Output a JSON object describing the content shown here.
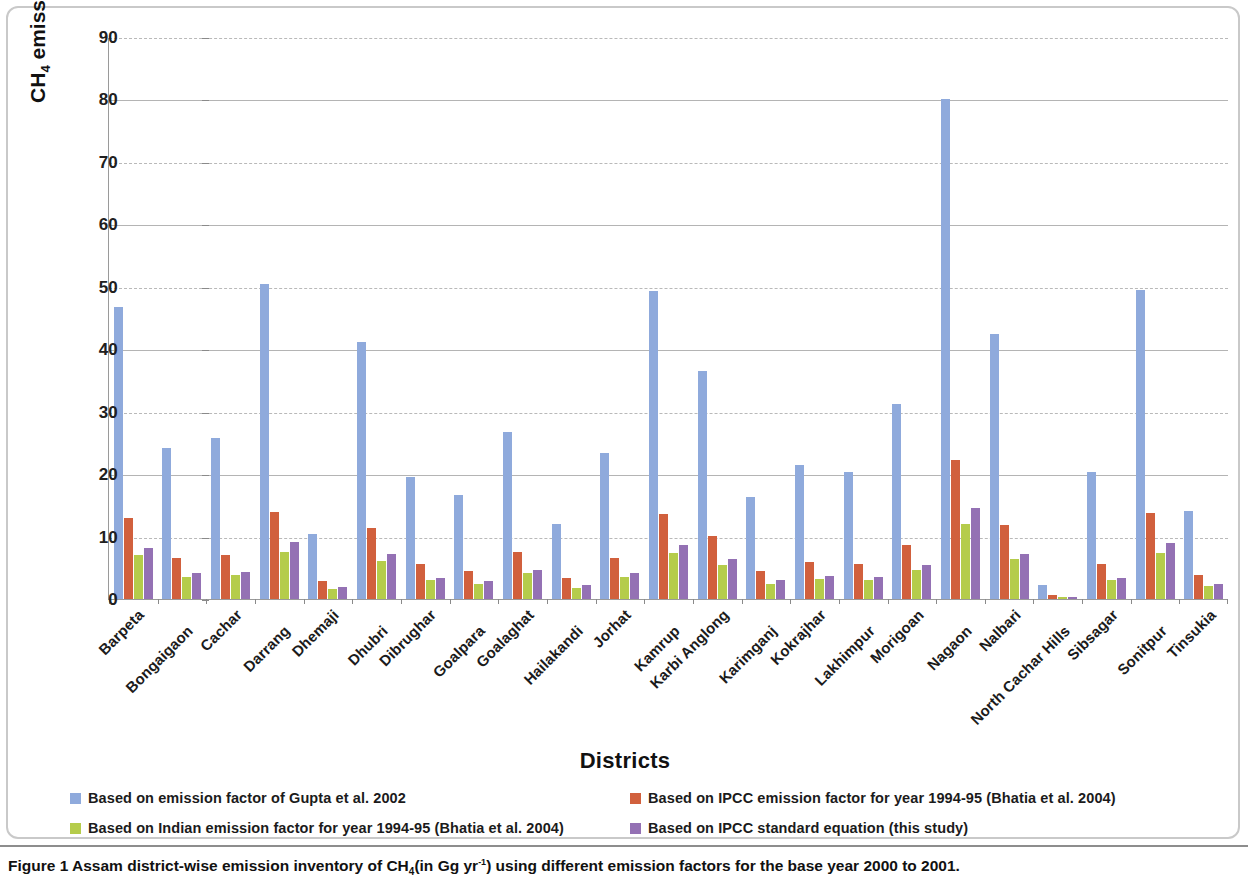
{
  "figure": {
    "caption_prefix": "Figure 1",
    "caption_text": "Assam district-wise emission inventory of CH",
    "caption_sub": "4",
    "caption_mid": "(in Gg yr",
    "caption_sup": "-1",
    "caption_tail": ") using different emission factors for the base year 2000 to 2001."
  },
  "axis": {
    "ylabel_main": "CH",
    "ylabel_sub": "4",
    "ylabel_rest": " emission (Gg yr",
    "ylabel_sup": "-1",
    "ylabel_close": ")",
    "xlabel": "Districts"
  },
  "colors": {
    "series1": "#8FAADC",
    "series2": "#D1603D",
    "series3": "#B5CC4B",
    "series4": "#9471B4",
    "gridline": "#b9b9b9",
    "axis": "#8a8a8a"
  },
  "legend": [
    {
      "label": "Based on emission factor of Gupta et al. 2002",
      "color": "#8FAADC"
    },
    {
      "label": "Based on IPCC emission factor for year 1994-95 (Bhatia et al. 2004)",
      "color": "#D1603D"
    },
    {
      "label": "Based on Indian  emission factor for year 1994-95 (Bhatia et al. 2004)",
      "color": "#B5CC4B"
    },
    {
      "label": "Based on IPCC standard equation (this study)",
      "color": "#9471B4"
    }
  ],
  "chart_data": {
    "type": "bar",
    "xlabel": "Districts",
    "ylabel": "CH4 emission (Gg yr-1)",
    "ylim": [
      0,
      90
    ],
    "ytick_values": [
      0,
      10,
      20,
      30,
      40,
      50,
      60,
      70,
      80,
      90
    ],
    "ytick_labels": [
      "0",
      "10",
      "20",
      "30",
      "40",
      "50",
      "60",
      "70",
      "80",
      "90"
    ],
    "grid": true,
    "legend_position": "bottom",
    "categories": [
      "Barpeta",
      "Bongaigaon",
      "Cachar",
      "Darrang",
      "Dhemaji",
      "Dhubri",
      "Dibrughar",
      "Goalpara",
      "Goalaghat",
      "Hailakandi",
      "Jorhat",
      "Kamrup",
      "Karbi Anglong",
      "Karimganj",
      "Kokrajhar",
      "Lakhimpur",
      "Morigoan",
      "Nagaon",
      "Nalbari",
      "North Cachar Hills",
      "Sibsagar",
      "Sonitpur",
      "Tinsukia"
    ],
    "series": [
      {
        "name": "Based on emission factor of Gupta et al. 2002",
        "color": "#8FAADC",
        "values": [
          46.8,
          24.2,
          25.8,
          50.5,
          10.4,
          41.2,
          19.5,
          16.7,
          26.8,
          12.0,
          23.4,
          49.4,
          36.5,
          16.3,
          21.4,
          20.3,
          31.2,
          80.0,
          42.4,
          2.2,
          20.3,
          49.5,
          14.1
        ]
      },
      {
        "name": "Based on IPCC emission factor for year 1994-95 (Bhatia et al. 2004)",
        "color": "#D1603D",
        "values": [
          12.9,
          6.5,
          7.1,
          13.9,
          2.9,
          11.3,
          5.6,
          4.5,
          7.6,
          3.3,
          6.5,
          13.6,
          10.1,
          4.5,
          5.9,
          5.6,
          8.7,
          22.2,
          11.8,
          0.6,
          5.6,
          13.7,
          3.9
        ]
      },
      {
        "name": "Based on Indian  emission factor for year 1994-95 (Bhatia et al. 2004)",
        "color": "#B5CC4B",
        "values": [
          7.0,
          3.5,
          3.8,
          7.5,
          1.6,
          6.1,
          3.0,
          2.4,
          4.1,
          1.8,
          3.5,
          7.4,
          5.5,
          2.4,
          3.2,
          3.0,
          4.7,
          12.0,
          6.4,
          0.3,
          3.0,
          7.4,
          2.1
        ]
      },
      {
        "name": "Based on IPCC standard equation (this study)",
        "color": "#9471B4",
        "values": [
          8.2,
          4.2,
          4.4,
          9.1,
          1.9,
          7.2,
          3.3,
          2.9,
          4.7,
          2.2,
          4.1,
          8.7,
          6.4,
          3.0,
          3.7,
          3.5,
          5.5,
          14.5,
          7.2,
          0.3,
          3.4,
          8.9,
          2.4
        ]
      }
    ]
  }
}
